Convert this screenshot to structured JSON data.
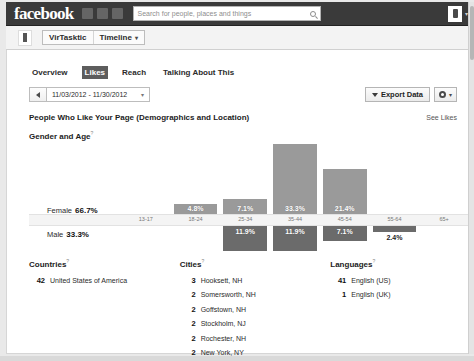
{
  "topbar": {
    "logo": "facebook",
    "search_placeholder": "Search for people, places and things",
    "search_icon": "search-icon",
    "icons": [
      "friend-requests-icon",
      "messages-icon",
      "notifications-icon"
    ],
    "avatar": "user-avatar",
    "caret": "▾"
  },
  "pagebar": {
    "page_name": "VirTasktic",
    "view": "Timeline",
    "caret": "▾"
  },
  "tabs": [
    {
      "label": "Overview",
      "active": false
    },
    {
      "label": "Likes",
      "active": true
    },
    {
      "label": "Reach",
      "active": false
    },
    {
      "label": "Talking About This",
      "active": false
    }
  ],
  "daterange": {
    "prev_icon": "prev-arrow-icon",
    "value": "11/03/2012 - 11/30/2012",
    "caret": "▾"
  },
  "actions": {
    "export_label": "Export Data",
    "export_icon": "download-icon",
    "gear_icon": "gear-icon",
    "gear_caret": "▾"
  },
  "section": {
    "title": "People Who Like Your Page (Demographics and Location)",
    "see_likes": "See Likes",
    "subtitle": "Gender and Age",
    "help_mark": "?"
  },
  "chart_data": {
    "type": "bar",
    "title": "Gender and Age",
    "categories": [
      "13-17",
      "18-24",
      "25-34",
      "35-44",
      "45-54",
      "55-64",
      "65+"
    ],
    "series": [
      {
        "name": "Female",
        "total": "66.7%",
        "values": [
          0,
          4.8,
          7.1,
          33.3,
          21.4,
          0,
          0
        ],
        "labels": [
          "",
          "4.8%",
          "7.1%",
          "33.3%",
          "21.4%",
          "",
          ""
        ],
        "color": "#9a9a9a"
      },
      {
        "name": "Male",
        "total": "33.3%",
        "values": [
          0,
          0,
          11.9,
          11.9,
          7.1,
          2.4,
          0
        ],
        "labels": [
          "",
          "",
          "11.9%",
          "11.9%",
          "7.1%",
          "2.4%",
          ""
        ],
        "color": "#6b6b6b"
      }
    ],
    "xlabel": "",
    "ylabel": "",
    "ylim": [
      0,
      35
    ],
    "grid": false,
    "legend": "left-inline",
    "orientation": "vertical-diverging"
  },
  "countries": {
    "title": "Countries",
    "help_mark": "?",
    "rows": [
      {
        "count": "42",
        "name": "United States of America"
      }
    ]
  },
  "cities": {
    "title": "Cities",
    "help_mark": "?",
    "rows": [
      {
        "count": "3",
        "name": "Hooksett, NH"
      },
      {
        "count": "2",
        "name": "Somersworth, NH"
      },
      {
        "count": "2",
        "name": "Goffstown, NH"
      },
      {
        "count": "2",
        "name": "Stockholm, NJ"
      },
      {
        "count": "2",
        "name": "Rochester, NH"
      },
      {
        "count": "2",
        "name": "New York, NY"
      }
    ]
  },
  "languages": {
    "title": "Languages",
    "help_mark": "?",
    "rows": [
      {
        "count": "41",
        "name": "English (US)"
      },
      {
        "count": "1",
        "name": "English (UK)"
      }
    ]
  }
}
